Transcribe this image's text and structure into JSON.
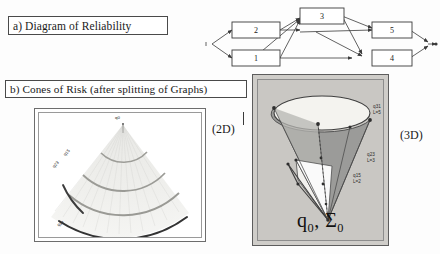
{
  "figure": {
    "panel_a": {
      "caption": "a) Diagram of Reliability",
      "diagram": {
        "type": "reliability-block-diagram",
        "source_node": "▸",
        "sink_node": "▸",
        "nodes": [
          {
            "id": "2",
            "label": "2"
          },
          {
            "id": "1",
            "label": "1"
          },
          {
            "id": "3",
            "label": "3"
          },
          {
            "id": "5",
            "label": "5"
          },
          {
            "id": "4",
            "label": "4"
          }
        ]
      }
    },
    "panel_b": {
      "caption": "b) Cones of Risk (after splitting of Graphs)",
      "view_2d": {
        "tag": "(2D)",
        "apex_label": "q0",
        "arc_labels": [
          "q15",
          "q23",
          "q31"
        ]
      },
      "view_3d": {
        "tag": "(3D)",
        "apex_label_q": "q",
        "apex_label_q_sub": "0",
        "apex_label_sigma": ", Σ",
        "apex_label_sigma_sub": "0",
        "side_labels": [
          {
            "q": "q31",
            "level": "L=5"
          },
          {
            "q": "q23",
            "level": "L=3"
          },
          {
            "q": "q15",
            "level": "L=2"
          }
        ]
      }
    }
  },
  "colors": {
    "cone_fill_dark": "#9b9b99",
    "cone_fill_light": "#f2f1ed",
    "panel_bg": "#c9c7c3",
    "line": "#3a3a3a"
  }
}
